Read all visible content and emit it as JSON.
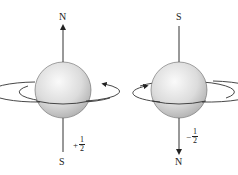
{
  "diagram": {
    "spins": [
      {
        "id": "spin-up",
        "top_label": "N",
        "bottom_label": "S",
        "value_sign": "+",
        "value_num": "1",
        "value_den": "2",
        "arrow_direction": "up",
        "rotation": "counterclockwise-front"
      },
      {
        "id": "spin-down",
        "top_label": "S",
        "bottom_label": "N",
        "value_sign": "−",
        "value_num": "1",
        "value_den": "2",
        "arrow_direction": "down",
        "rotation": "clockwise-front"
      }
    ],
    "colors": {
      "sphere_light": "#f4f4f4",
      "sphere_dark": "#a8a8a8",
      "line": "#222222"
    }
  }
}
